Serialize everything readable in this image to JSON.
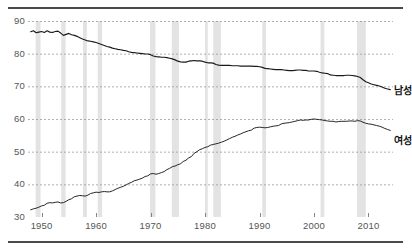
{
  "figure": {
    "background": "#ffffff",
    "rule_color": "#4a4a4a",
    "line_color": "#1a1a1a",
    "grid_color": "#9a9a9a",
    "band_color": "#e3e3e3",
    "tick_text_color": "#555555"
  },
  "legend": {
    "male_label": "남성",
    "female_label": "여성"
  },
  "chart_data": {
    "type": "line",
    "title": "",
    "subtitle": "",
    "xlabel": "",
    "ylabel": "",
    "xlim": [
      1947.5,
      2014.5
    ],
    "ylim": [
      30,
      90
    ],
    "grid": true,
    "grid_axis": "y",
    "legend_position": "right-inline",
    "yticks": [
      30,
      40,
      50,
      60,
      70,
      80,
      90
    ],
    "ytick_labels": [
      "30",
      "40",
      "50",
      "60",
      "70",
      "80",
      "90"
    ],
    "xticks": [
      1950,
      1960,
      1970,
      1980,
      1990,
      2000,
      2010
    ],
    "xtick_labels": [
      "1950",
      "1960",
      "1970",
      "1980",
      "1990",
      "2000",
      "2010"
    ],
    "annotations": [
      {
        "text": "남성",
        "x": 2015.5,
        "y": 69.0
      },
      {
        "text": "여성",
        "x": 2015.5,
        "y": 56.5
      }
    ],
    "recession_bands": [
      {
        "start": 1948.9,
        "end": 1949.8
      },
      {
        "start": 1953.6,
        "end": 1954.4
      },
      {
        "start": 1957.6,
        "end": 1958.3
      },
      {
        "start": 1960.3,
        "end": 1961.1
      },
      {
        "start": 1969.9,
        "end": 1970.9
      },
      {
        "start": 1973.9,
        "end": 1975.2
      },
      {
        "start": 1980.0,
        "end": 1980.5
      },
      {
        "start": 1981.5,
        "end": 1982.9
      },
      {
        "start": 1990.5,
        "end": 1991.2
      },
      {
        "start": 2001.2,
        "end": 2001.9
      },
      {
        "start": 2007.9,
        "end": 2009.5
      }
    ],
    "series": [
      {
        "name": "남성",
        "x": [
          1948,
          1948.5,
          1949,
          1949.5,
          1950,
          1950.5,
          1951,
          1951.5,
          1952,
          1952.5,
          1953,
          1953.5,
          1954,
          1954.5,
          1955,
          1955.5,
          1956,
          1956.5,
          1957,
          1957.5,
          1958,
          1958.5,
          1959,
          1959.5,
          1960,
          1960.5,
          1961,
          1961.5,
          1962,
          1962.5,
          1963,
          1963.5,
          1964,
          1964.5,
          1965,
          1965.5,
          1966,
          1966.5,
          1967,
          1967.5,
          1968,
          1968.5,
          1969,
          1969.5,
          1970,
          1970.5,
          1971,
          1971.5,
          1972,
          1972.5,
          1973,
          1973.5,
          1974,
          1974.5,
          1975,
          1975.5,
          1976,
          1976.5,
          1977,
          1977.5,
          1978,
          1978.5,
          1979,
          1979.5,
          1980,
          1980.5,
          1981,
          1981.5,
          1982,
          1982.5,
          1983,
          1983.5,
          1984,
          1984.5,
          1985,
          1985.5,
          1986,
          1986.5,
          1987,
          1987.5,
          1988,
          1988.5,
          1989,
          1989.5,
          1990,
          1990.5,
          1991,
          1991.5,
          1992,
          1992.5,
          1993,
          1993.5,
          1994,
          1994.5,
          1995,
          1995.5,
          1996,
          1996.5,
          1997,
          1997.5,
          1998,
          1998.5,
          1999,
          1999.5,
          2000,
          2000.5,
          2001,
          2001.5,
          2002,
          2002.5,
          2003,
          2003.5,
          2004,
          2004.5,
          2005,
          2005.5,
          2006,
          2006.5,
          2007,
          2007.5,
          2008,
          2008.5,
          2009,
          2009.5,
          2010,
          2010.5,
          2011,
          2011.5,
          2012,
          2012.5,
          2013,
          2013.5,
          2014
        ],
        "values": [
          86.7,
          87.0,
          86.4,
          86.6,
          86.8,
          86.5,
          87.0,
          86.6,
          86.5,
          86.8,
          86.9,
          86.3,
          85.6,
          85.9,
          86.2,
          85.8,
          85.6,
          85.3,
          84.9,
          84.5,
          84.2,
          83.9,
          83.8,
          83.6,
          83.4,
          83.1,
          82.8,
          82.5,
          82.2,
          82.0,
          81.7,
          81.5,
          81.3,
          81.2,
          81.0,
          80.9,
          80.6,
          80.4,
          80.3,
          80.2,
          80.1,
          80.0,
          79.9,
          79.9,
          79.7,
          79.3,
          79.1,
          79.0,
          78.9,
          78.9,
          78.8,
          78.6,
          78.4,
          78.1,
          77.7,
          77.5,
          77.4,
          77.4,
          77.7,
          77.8,
          77.9,
          77.8,
          77.8,
          77.7,
          77.4,
          77.2,
          77.2,
          77.1,
          76.7,
          76.5,
          76.4,
          76.4,
          76.4,
          76.4,
          76.3,
          76.3,
          76.3,
          76.2,
          76.2,
          76.2,
          76.2,
          76.2,
          76.1,
          76.1,
          76.0,
          75.8,
          75.5,
          75.4,
          75.3,
          75.2,
          75.1,
          75.1,
          75.1,
          75.0,
          74.9,
          74.8,
          74.8,
          74.9,
          75.0,
          75.0,
          74.9,
          74.9,
          74.7,
          74.7,
          74.7,
          74.6,
          74.3,
          74.1,
          74.0,
          73.9,
          73.5,
          73.4,
          73.3,
          73.3,
          73.3,
          73.3,
          73.4,
          73.4,
          73.3,
          73.2,
          73.0,
          72.7,
          72.0,
          71.4,
          71.1,
          70.7,
          70.5,
          70.3,
          70.1,
          69.8,
          69.4,
          69.2,
          69.0
        ]
      },
      {
        "name": "여성",
        "x": [
          1948,
          1948.5,
          1949,
          1949.5,
          1950,
          1950.5,
          1951,
          1951.5,
          1952,
          1952.5,
          1953,
          1953.5,
          1954,
          1954.5,
          1955,
          1955.5,
          1956,
          1956.5,
          1957,
          1957.5,
          1958,
          1958.5,
          1959,
          1959.5,
          1960,
          1960.5,
          1961,
          1961.5,
          1962,
          1962.5,
          1963,
          1963.5,
          1964,
          1964.5,
          1965,
          1965.5,
          1966,
          1966.5,
          1967,
          1967.5,
          1968,
          1968.5,
          1969,
          1969.5,
          1970,
          1970.5,
          1971,
          1971.5,
          1972,
          1972.5,
          1973,
          1973.5,
          1974,
          1974.5,
          1975,
          1975.5,
          1976,
          1976.5,
          1977,
          1977.5,
          1978,
          1978.5,
          1979,
          1979.5,
          1980,
          1980.5,
          1981,
          1981.5,
          1982,
          1982.5,
          1983,
          1983.5,
          1984,
          1984.5,
          1985,
          1985.5,
          1986,
          1986.5,
          1987,
          1987.5,
          1988,
          1988.5,
          1989,
          1989.5,
          1990,
          1990.5,
          1991,
          1991.5,
          1992,
          1992.5,
          1993,
          1993.5,
          1994,
          1994.5,
          1995,
          1995.5,
          1996,
          1996.5,
          1997,
          1997.5,
          1998,
          1998.5,
          1999,
          1999.5,
          2000,
          2000.5,
          2001,
          2001.5,
          2002,
          2002.5,
          2003,
          2003.5,
          2004,
          2004.5,
          2005,
          2005.5,
          2006,
          2006.5,
          2007,
          2007.5,
          2008,
          2008.5,
          2009,
          2009.5,
          2010,
          2010.5,
          2011,
          2011.5,
          2012,
          2012.5,
          2013,
          2013.5,
          2014
        ],
        "values": [
          32.2,
          32.5,
          32.7,
          33.0,
          33.4,
          33.6,
          34.2,
          34.4,
          34.3,
          34.5,
          34.6,
          34.3,
          34.4,
          34.8,
          35.3,
          35.6,
          36.2,
          36.4,
          36.6,
          36.5,
          36.4,
          36.7,
          37.2,
          37.4,
          37.6,
          37.5,
          37.7,
          37.8,
          37.7,
          37.7,
          38.0,
          38.4,
          38.8,
          39.1,
          39.4,
          39.8,
          40.3,
          40.6,
          41.1,
          41.3,
          41.6,
          41.9,
          42.4,
          42.6,
          43.2,
          43.3,
          43.1,
          43.3,
          43.6,
          43.9,
          44.5,
          44.9,
          45.4,
          45.6,
          46.0,
          46.3,
          47.0,
          47.4,
          48.1,
          48.5,
          49.5,
          50.0,
          50.6,
          50.9,
          51.3,
          51.5,
          52.0,
          52.2,
          52.4,
          52.6,
          52.9,
          53.2,
          53.6,
          54.0,
          54.4,
          54.7,
          55.1,
          55.4,
          55.8,
          56.1,
          56.4,
          56.6,
          57.2,
          57.4,
          57.5,
          57.4,
          57.3,
          57.4,
          57.6,
          57.8,
          57.9,
          58.0,
          58.5,
          58.7,
          58.8,
          58.9,
          59.1,
          59.3,
          59.5,
          59.7,
          59.6,
          59.7,
          59.7,
          59.9,
          60.0,
          59.9,
          59.8,
          59.7,
          59.5,
          59.4,
          59.3,
          59.3,
          59.1,
          59.2,
          59.3,
          59.3,
          59.3,
          59.4,
          59.4,
          59.3,
          59.5,
          59.4,
          59.0,
          58.7,
          58.5,
          58.4,
          58.2,
          58.0,
          57.8,
          57.5,
          57.1,
          56.8,
          56.5
        ]
      }
    ]
  }
}
